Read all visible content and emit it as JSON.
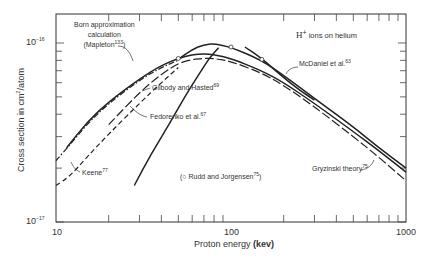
{
  "chart_data": {
    "type": "line",
    "title": "H+ ions on helium",
    "xlabel": "Proton energy (kev)",
    "ylabel": "Cross section in cm²/atom",
    "xscale": "log",
    "yscale": "log",
    "xlim": [
      10,
      1000
    ],
    "ylim": [
      1e-17,
      1.6e-16
    ],
    "x_tick_labels": [
      "10",
      "100",
      "1000"
    ],
    "y_tick_labels": [
      "10^-17",
      "10^-16"
    ],
    "grid": false,
    "series": [
      {
        "name": "Born approximation calculation (Mapleton 133)",
        "style": "solid",
        "x": [
          11.5,
          15,
          20,
          30,
          40,
          50,
          60,
          70,
          80,
          100,
          150,
          200,
          300,
          500,
          700,
          1000
        ],
        "y": [
          2.6e-17,
          3.6e-17,
          4.7e-17,
          6.3e-17,
          7.5e-17,
          8.2e-17,
          8.6e-17,
          8.7e-17,
          8.6e-17,
          8.2e-17,
          7e-17,
          6e-17,
          4.6e-17,
          3.2e-17,
          2.5e-17,
          1.9e-17
        ]
      },
      {
        "name": "Gilbody and Hasted 69",
        "style": "dash-dot",
        "x": [
          10,
          12,
          15,
          20,
          30,
          40,
          50
        ],
        "y": [
          2.2e-17,
          2.7e-17,
          3.5e-17,
          4.6e-17,
          6.2e-17,
          7.3e-17,
          8e-17
        ]
      },
      {
        "name": "Fedorenko et al. 67",
        "style": "solid",
        "x": [
          28,
          35,
          45,
          55,
          65,
          75,
          85
        ],
        "y": [
          1.6e-17,
          2.4e-17,
          3.6e-17,
          5.1e-17,
          6.6e-17,
          8.2e-17,
          9.4e-17
        ]
      },
      {
        "name": "Keene 77",
        "style": "dashed",
        "x": [
          10,
          12,
          15,
          20,
          30,
          40,
          50
        ],
        "y": [
          1.6e-17,
          1.8e-17,
          2.3e-17,
          3.1e-17,
          4.6e-17,
          6e-17,
          7.3e-17
        ]
      },
      {
        "name": "Experimental (solid, peaking ~80 keV)",
        "style": "solid",
        "x": [
          50,
          60,
          70,
          80,
          100,
          150,
          200,
          300,
          500,
          700,
          1000
        ],
        "y": [
          8.1e-17,
          9.2e-17,
          9.8e-17,
          9.9e-17,
          9.5e-17,
          8e-17,
          6.6e-17,
          4.9e-17,
          3.4e-17,
          2.6e-17,
          2e-17
        ]
      },
      {
        "name": "Gryzinski theory 75",
        "style": "long-dash",
        "x": [
          20,
          30,
          40,
          50,
          60,
          70,
          80,
          100,
          150,
          200,
          300,
          500,
          700,
          1000
        ],
        "y": [
          3.5e-17,
          5.3e-17,
          6.7e-17,
          7.7e-17,
          8.1e-17,
          8.2e-17,
          8.2e-17,
          7.9e-17,
          6.8e-17,
          5.8e-17,
          4.4e-17,
          3e-17,
          2.3e-17,
          1.7e-17
        ]
      },
      {
        "name": "McDaniel et al. 63",
        "style": "solid",
        "x": [
          120,
          150,
          200,
          250,
          300
        ],
        "y": [
          9.5e-17,
          8.2e-17,
          6.4e-17,
          5.4e-17,
          4.8e-17
        ]
      },
      {
        "name": "Rudd and Jorgensen 75",
        "style": "markers-circle",
        "x": [
          50,
          100,
          150
        ],
        "y": [
          8.2e-17,
          9.5e-17,
          8.1e-17
        ]
      }
    ],
    "annotations": [
      "Born approximation calculation (Mapleton 133)",
      "Gilbody and Hasted 69",
      "Fedorenko et al. 67",
      "Keene 77",
      "(○ Rudd and Jorgensen 75)",
      "McDaniel et al. 63",
      "Gryzinski theory 75",
      "H+ ions on helium"
    ]
  },
  "labels": {
    "title_main": "H",
    "title_sup": "+",
    "title_rest": " ions on helium",
    "born_line1": "Born approximation",
    "born_line2": "calculation",
    "born_line3": "(Mapleton",
    "born_ref": "133",
    "born_close": ")",
    "gilbody": "Gilbody and Hasted",
    "gilbody_ref": "69",
    "fedorenko": "Fedorenko et al.",
    "fedorenko_ref": "67",
    "keene": "Keene",
    "keene_ref": "77",
    "rudd": "(○ Rudd and Jorgensen",
    "rudd_ref": "75",
    "rudd_close": ")",
    "mcdaniel": "McDaniel et al.",
    "mcdaniel_ref": "63",
    "gryzinski": "Gryzinski theory",
    "gryzinski_ref": "75"
  },
  "axes": {
    "x_title": "Proton energy ",
    "x_unit": "(kev)",
    "y_title": "Cross section in cm",
    "y_sup": "2",
    "y_rest": "/atom",
    "x_ticks": [
      "10",
      "100",
      "1000"
    ],
    "y_ticks": [
      {
        "base": "10",
        "exp": "−16"
      },
      {
        "base": "10",
        "exp": "−17"
      }
    ]
  }
}
